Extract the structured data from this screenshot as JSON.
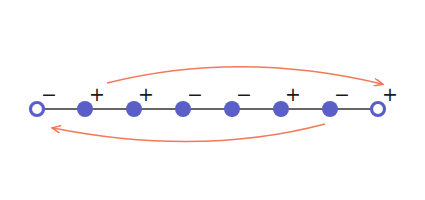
{
  "diagram": {
    "colors": {
      "node": "#5a5fc8",
      "line": "#333333",
      "arrow": "#f07a5a",
      "sign": "#1a1a1a",
      "background": "#ffffff"
    },
    "nodes": [
      {
        "x": 37,
        "type": "open",
        "sign": "−"
      },
      {
        "x": 85,
        "type": "filled",
        "sign": "+"
      },
      {
        "x": 134,
        "type": "filled",
        "sign": "+"
      },
      {
        "x": 183,
        "type": "filled",
        "sign": "−"
      },
      {
        "x": 232,
        "type": "filled",
        "sign": "−"
      },
      {
        "x": 281,
        "type": "filled",
        "sign": "+"
      },
      {
        "x": 330,
        "type": "filled",
        "sign": "−"
      },
      {
        "x": 378,
        "type": "open",
        "sign": "+"
      }
    ],
    "arrows": [
      {
        "name": "top-arrow",
        "direction": "left-to-right"
      },
      {
        "name": "bottom-arrow",
        "direction": "right-to-left"
      }
    ]
  }
}
